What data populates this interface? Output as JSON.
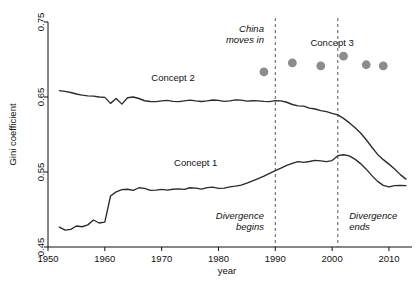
{
  "chart_data": {
    "type": "line",
    "title": "",
    "xlabel": "year",
    "ylabel": "Gini coefficient",
    "xlim": [
      1950,
      2013
    ],
    "ylim": [
      0.45,
      0.75
    ],
    "grid": false,
    "legend_position": "inline-labels",
    "xticks": [
      1950,
      1960,
      1970,
      1980,
      1990,
      2000,
      2010
    ],
    "xtick_labels": [
      "1950",
      "1960",
      "1970",
      "1980",
      "1990",
      "2000",
      "2010"
    ],
    "yticks": [
      0.45,
      0.55,
      0.65,
      0.75
    ],
    "ytick_labels": [
      "0.45",
      "0.55",
      "0.65",
      "0.75"
    ],
    "series": [
      {
        "name": "Concept 2",
        "marker": "none",
        "color": "#2b2b2b",
        "label_x": 1972,
        "label_y": 0.672,
        "points": [
          [
            1952,
            0.6585
          ],
          [
            1953,
            0.6575
          ],
          [
            1954,
            0.656
          ],
          [
            1955,
            0.654
          ],
          [
            1956,
            0.6525
          ],
          [
            1957,
            0.6515
          ],
          [
            1958,
            0.6512
          ],
          [
            1959,
            0.65
          ],
          [
            1960,
            0.6495
          ],
          [
            1961,
            0.6415
          ],
          [
            1962,
            0.648
          ],
          [
            1963,
            0.6405
          ],
          [
            1964,
            0.649
          ],
          [
            1965,
            0.65
          ],
          [
            1966,
            0.648
          ],
          [
            1967,
            0.645
          ],
          [
            1968,
            0.644
          ],
          [
            1969,
            0.6438
          ],
          [
            1970,
            0.6448
          ],
          [
            1971,
            0.6455
          ],
          [
            1972,
            0.6442
          ],
          [
            1973,
            0.6438
          ],
          [
            1974,
            0.6448
          ],
          [
            1975,
            0.6458
          ],
          [
            1976,
            0.6448
          ],
          [
            1977,
            0.644
          ],
          [
            1978,
            0.6448
          ],
          [
            1979,
            0.646
          ],
          [
            1980,
            0.6455
          ],
          [
            1981,
            0.6442
          ],
          [
            1982,
            0.6448
          ],
          [
            1983,
            0.6462
          ],
          [
            1984,
            0.6458
          ],
          [
            1985,
            0.6445
          ],
          [
            1986,
            0.645
          ],
          [
            1987,
            0.6448
          ],
          [
            1988,
            0.6442
          ],
          [
            1989,
            0.6438
          ],
          [
            1990,
            0.6452
          ],
          [
            1991,
            0.6448
          ],
          [
            1992,
            0.643
          ],
          [
            1993,
            0.64
          ],
          [
            1994,
            0.6382
          ],
          [
            1995,
            0.6378
          ],
          [
            1996,
            0.6352
          ],
          [
            1997,
            0.634
          ],
          [
            1998,
            0.6318
          ],
          [
            1999,
            0.6305
          ],
          [
            2000,
            0.6282
          ],
          [
            2001,
            0.6262
          ],
          [
            2002,
            0.6215
          ],
          [
            2003,
            0.6158
          ],
          [
            2004,
            0.6092
          ],
          [
            2005,
            0.602
          ],
          [
            2006,
            0.593
          ],
          [
            2007,
            0.583
          ],
          [
            2008,
            0.5735
          ],
          [
            2009,
            0.5665
          ],
          [
            2010,
            0.5605
          ],
          [
            2011,
            0.554
          ],
          [
            2012,
            0.5465
          ],
          [
            2013,
            0.5405
          ]
        ]
      },
      {
        "name": "Concept 1",
        "marker": "none",
        "color": "#2b2b2b",
        "label_x": 1976,
        "label_y": 0.558,
        "points": [
          [
            1952,
            0.4765
          ],
          [
            1953,
            0.4725
          ],
          [
            1954,
            0.4735
          ],
          [
            1955,
            0.478
          ],
          [
            1956,
            0.477
          ],
          [
            1957,
            0.4795
          ],
          [
            1958,
            0.486
          ],
          [
            1959,
            0.482
          ],
          [
            1960,
            0.4832
          ],
          [
            1961,
            0.518
          ],
          [
            1962,
            0.5235
          ],
          [
            1963,
            0.5265
          ],
          [
            1964,
            0.527
          ],
          [
            1965,
            0.5255
          ],
          [
            1966,
            0.529
          ],
          [
            1967,
            0.5282
          ],
          [
            1968,
            0.5255
          ],
          [
            1969,
            0.5258
          ],
          [
            1970,
            0.5268
          ],
          [
            1971,
            0.5258
          ],
          [
            1972,
            0.527
          ],
          [
            1973,
            0.5275
          ],
          [
            1974,
            0.5268
          ],
          [
            1975,
            0.529
          ],
          [
            1976,
            0.5285
          ],
          [
            1977,
            0.5272
          ],
          [
            1978,
            0.5292
          ],
          [
            1979,
            0.5298
          ],
          [
            1980,
            0.5282
          ],
          [
            1981,
            0.5285
          ],
          [
            1982,
            0.5302
          ],
          [
            1983,
            0.5312
          ],
          [
            1984,
            0.5325
          ],
          [
            1985,
            0.5352
          ],
          [
            1986,
            0.5382
          ],
          [
            1987,
            0.5412
          ],
          [
            1988,
            0.5445
          ],
          [
            1989,
            0.5482
          ],
          [
            1990,
            0.5518
          ],
          [
            1991,
            0.5552
          ],
          [
            1992,
            0.5588
          ],
          [
            1993,
            0.5615
          ],
          [
            1994,
            0.5638
          ],
          [
            1995,
            0.5628
          ],
          [
            1996,
            0.564
          ],
          [
            1997,
            0.5655
          ],
          [
            1998,
            0.5648
          ],
          [
            1999,
            0.5638
          ],
          [
            2000,
            0.5652
          ],
          [
            2001,
            0.5718
          ],
          [
            2002,
            0.573
          ],
          [
            2003,
            0.5715
          ],
          [
            2004,
            0.5672
          ],
          [
            2005,
            0.5612
          ],
          [
            2006,
            0.5538
          ],
          [
            2007,
            0.5452
          ],
          [
            2008,
            0.5375
          ],
          [
            2009,
            0.5322
          ],
          [
            2010,
            0.5302
          ],
          [
            2011,
            0.5318
          ],
          [
            2012,
            0.5322
          ],
          [
            2013,
            0.5318
          ]
        ]
      },
      {
        "name": "Concept 3",
        "marker": "circle",
        "color": "#8c8c8c",
        "label_x": 2000,
        "label_y": 0.718,
        "points": [
          [
            1988,
            0.6835
          ],
          [
            1993,
            0.6955
          ],
          [
            1998,
            0.6915
          ],
          [
            2002,
            0.7045
          ],
          [
            2006,
            0.693
          ],
          [
            2009,
            0.6915
          ]
        ]
      }
    ],
    "reference_lines": [
      {
        "name": "china-moves-in-line",
        "x": 1990,
        "style": "dashed"
      },
      {
        "name": "divergence-ends-line",
        "x": 2001,
        "style": "dashed"
      }
    ],
    "annotations": [
      {
        "name": "china-moves-in",
        "text_line1": "China",
        "text_line2": "moves in",
        "x": 1988,
        "y": 0.737,
        "align": "end",
        "italic": true
      },
      {
        "name": "divergence-begins",
        "text_line1": "Divergence",
        "text_line2": "begins",
        "x": 1988,
        "y": 0.487,
        "align": "end",
        "italic": true
      },
      {
        "name": "divergence-ends",
        "text_line1": "Divergence",
        "text_line2": "ends",
        "x": 2003,
        "y": 0.487,
        "align": "start",
        "italic": true
      }
    ]
  },
  "axes": {
    "ylabel": "Gini coefficient",
    "xlabel": "year"
  }
}
